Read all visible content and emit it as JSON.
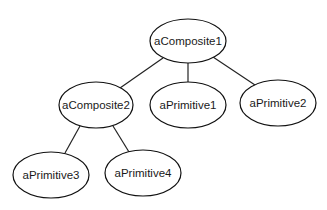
{
  "diagram": {
    "type": "object-tree",
    "nodes": [
      {
        "id": "aComposite1",
        "label": "aComposite1",
        "cx": 188,
        "cy": 41,
        "rx": 38,
        "ry": 22
      },
      {
        "id": "aComposite2",
        "label": "aComposite2",
        "cx": 96,
        "cy": 105,
        "rx": 37,
        "ry": 23
      },
      {
        "id": "aPrimitive1",
        "label": "aPrimitive1",
        "cx": 188,
        "cy": 105,
        "rx": 38,
        "ry": 23
      },
      {
        "id": "aPrimitive2",
        "label": "aPrimitive2",
        "cx": 278,
        "cy": 103,
        "rx": 38,
        "ry": 23
      },
      {
        "id": "aPrimitive3",
        "label": "aPrimitive3",
        "cx": 51,
        "cy": 175,
        "rx": 38,
        "ry": 23
      },
      {
        "id": "aPrimitive4",
        "label": "aPrimitive4",
        "cx": 143,
        "cy": 173,
        "rx": 38,
        "ry": 23
      }
    ],
    "edges": [
      {
        "from": "aComposite1",
        "to": "aComposite2",
        "x1": 163,
        "y1": 58,
        "x2": 120,
        "y2": 88
      },
      {
        "from": "aComposite1",
        "to": "aPrimitive1",
        "x1": 188,
        "y1": 63,
        "x2": 188,
        "y2": 82
      },
      {
        "from": "aComposite1",
        "to": "aPrimitive2",
        "x1": 213,
        "y1": 57,
        "x2": 255,
        "y2": 85
      },
      {
        "from": "aComposite2",
        "to": "aPrimitive3",
        "x1": 80,
        "y1": 126,
        "x2": 65,
        "y2": 153
      },
      {
        "from": "aComposite2",
        "to": "aPrimitive4",
        "x1": 113,
        "y1": 126,
        "x2": 129,
        "y2": 152
      }
    ]
  }
}
